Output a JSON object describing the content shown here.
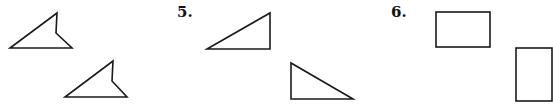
{
  "problems": [
    {
      "number": "5."
    },
    {
      "number": "6."
    }
  ],
  "colors": {
    "stroke": "#1a1a1a",
    "background": "#ffffff"
  }
}
